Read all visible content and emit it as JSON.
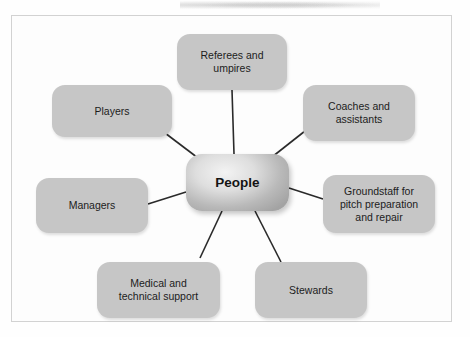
{
  "diagram": {
    "title_visible": false,
    "center": {
      "label": "People",
      "x": 186,
      "y": 154,
      "w": 103,
      "h": 57
    },
    "colors": {
      "node_fill": "#c6c6c6",
      "center_fill_light": "#f3f3f3",
      "center_fill_dark": "#a3a3a3",
      "text": "#1c1c1c",
      "connector": "#2a2a2a",
      "frame_border": "#d2d2d2",
      "background": "#fefefe"
    },
    "nodes": [
      {
        "id": "referees-and-umpires",
        "label": "Referees and\numpires",
        "x": 177,
        "y": 34,
        "w": 110,
        "h": 56,
        "connector": {
          "x1": 232,
          "y1": 90,
          "x2": 234,
          "y2": 154
        }
      },
      {
        "id": "coaches-and-assistants",
        "label": "Coaches and\nassistants",
        "x": 303,
        "y": 85,
        "w": 112,
        "h": 56,
        "connector": {
          "x1": 305,
          "y1": 131,
          "x2": 272,
          "y2": 157
        }
      },
      {
        "id": "groundstaff-for-pitch-preparation-and-repair",
        "label": "Groundstaff for\npitch preparation\nand repair",
        "x": 323,
        "y": 175,
        "w": 112,
        "h": 58,
        "connector": {
          "x1": 323,
          "y1": 199,
          "x2": 289,
          "y2": 188
        }
      },
      {
        "id": "stewards",
        "label": "Stewards",
        "x": 255,
        "y": 262,
        "w": 112,
        "h": 56,
        "connector": {
          "x1": 281,
          "y1": 262,
          "x2": 255,
          "y2": 211
        }
      },
      {
        "id": "medical-and-technical-support",
        "label": "Medical and\ntechnical support",
        "x": 97,
        "y": 262,
        "w": 123,
        "h": 56,
        "connector": {
          "x1": 200,
          "y1": 258,
          "x2": 222,
          "y2": 211
        }
      },
      {
        "id": "managers",
        "label": "Managers",
        "x": 36,
        "y": 178,
        "w": 112,
        "h": 55,
        "connector": {
          "x1": 148,
          "y1": 204,
          "x2": 186,
          "y2": 192
        }
      },
      {
        "id": "players",
        "label": "Players",
        "x": 52,
        "y": 85,
        "w": 120,
        "h": 52,
        "connector": {
          "x1": 165,
          "y1": 133,
          "x2": 198,
          "y2": 158
        }
      }
    ]
  }
}
